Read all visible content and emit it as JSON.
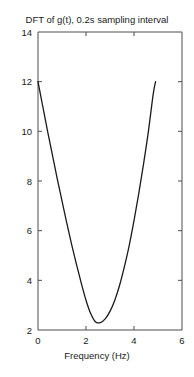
{
  "chart_data": {
    "type": "line",
    "title": "DFT of g(t), 0.2s sampling interval",
    "xlabel": "Frequency (Hz)",
    "ylabel": "",
    "xlim": [
      0,
      6
    ],
    "ylim": [
      2,
      14
    ],
    "xticks": [
      0,
      2,
      4,
      6
    ],
    "xtick_labels": [
      "0",
      "2",
      "4",
      "6"
    ],
    "yticks": [
      2,
      4,
      6,
      8,
      10,
      12,
      14
    ],
    "ytick_labels": [
      "2",
      "4",
      "6",
      "8",
      "10",
      "12",
      "14"
    ],
    "grid": false,
    "legend": null,
    "line_color": "#1a1a1a",
    "axis_color": "#4d4d4d",
    "background_color": "#ffffff",
    "series": [
      {
        "name": "DFT magnitude",
        "x": [
          0.0,
          0.2,
          0.4,
          0.6,
          0.8,
          1.0,
          1.2,
          1.4,
          1.6,
          1.8,
          2.0,
          2.2,
          2.4,
          2.6,
          2.8,
          3.0,
          3.2,
          3.4,
          3.6,
          3.8,
          4.0,
          4.2,
          4.4,
          4.6,
          4.8,
          4.9
        ],
        "y": [
          12.0,
          11.0,
          10.0,
          9.05,
          8.1,
          7.2,
          6.3,
          5.45,
          4.65,
          3.9,
          3.2,
          2.65,
          2.32,
          2.3,
          2.45,
          2.75,
          3.2,
          3.8,
          4.55,
          5.4,
          6.4,
          7.5,
          8.7,
          10.0,
          11.5,
          12.0
        ]
      }
    ],
    "annotations": []
  }
}
